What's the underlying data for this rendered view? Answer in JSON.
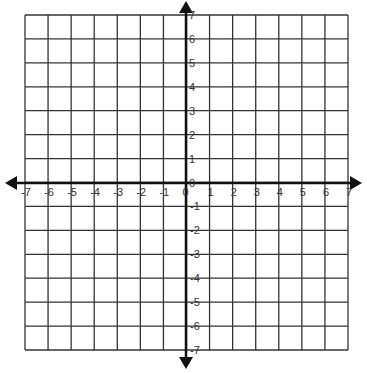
{
  "diagram": {
    "type": "coordinate-plane",
    "x_range": [
      -7,
      7
    ],
    "y_range": [
      -7,
      7
    ],
    "grid_step": 1,
    "x_tick_labels": [
      "-7",
      "-6",
      "-5",
      "-4",
      "-3",
      "-2",
      "-1",
      "0",
      "1",
      "2",
      "3",
      "4",
      "5",
      "6",
      "7"
    ],
    "y_tick_labels": [
      "7",
      "6",
      "5",
      "4",
      "3",
      "2",
      "1",
      "0",
      "-1",
      "-2",
      "-3",
      "-4",
      "-5",
      "-6",
      "-7"
    ],
    "origin_label": "0",
    "colors": {
      "grid": "#333333",
      "axis": "#111111",
      "label": "#333333",
      "background": "#ffffff"
    }
  }
}
